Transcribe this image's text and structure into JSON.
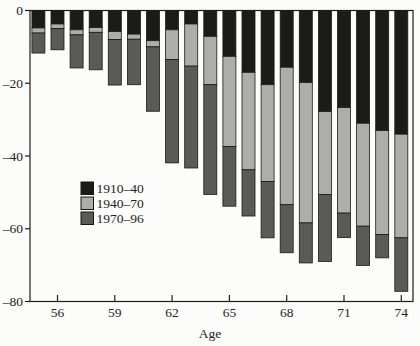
{
  "figure": {
    "xlabel": "Age",
    "background": "#fcfcfa",
    "axis_color": "#1c1c1a"
  },
  "chart_data": {
    "type": "bar",
    "stacked": true,
    "direction": "downward",
    "title": "",
    "xlabel": "Age",
    "ylabel": "",
    "ylim": [
      -80,
      0
    ],
    "yticks": [
      0,
      -20,
      -40,
      -60,
      -80
    ],
    "ytick_labels": [
      "0",
      "–20",
      "–40",
      "–60",
      "–80"
    ],
    "xticks": [
      56,
      59,
      62,
      65,
      68,
      71,
      74
    ],
    "xtick_labels": [
      "56",
      "59",
      "62",
      "65",
      "68",
      "71",
      "74"
    ],
    "grid": false,
    "legend_position": "inside-center-left",
    "categories": [
      55,
      56,
      57,
      58,
      59,
      60,
      61,
      62,
      63,
      64,
      65,
      66,
      67,
      68,
      69,
      70,
      71,
      72,
      73,
      74
    ],
    "series": [
      {
        "name": "1910–40",
        "color": "#1b1b18",
        "values": [
          -4.8,
          -3.7,
          -5.3,
          -4.7,
          -5.8,
          -6.5,
          -8.3,
          -5.3,
          -3.7,
          -7.1,
          -12.6,
          -17.0,
          -20.4,
          -15.6,
          -19.8,
          -27.8,
          -26.7,
          -31.0,
          -33.0,
          -34.0
        ]
      },
      {
        "name": "1940–70",
        "color": "#adadab",
        "values": [
          -1.4,
          -1.3,
          -1.4,
          -1.3,
          -2.2,
          -1.4,
          -1.7,
          -8.2,
          -11.6,
          -13.3,
          -24.8,
          -26.8,
          -26.6,
          -37.8,
          -38.6,
          -22.8,
          -29.0,
          -28.3,
          -28.6,
          -28.5
        ]
      },
      {
        "name": "1970–96",
        "color": "#5a5a58",
        "values": [
          -5.5,
          -5.8,
          -9.1,
          -10.3,
          -12.5,
          -12.5,
          -17.7,
          -28.4,
          -28.0,
          -30.2,
          -16.4,
          -12.7,
          -15.5,
          -13.2,
          -11.0,
          -18.4,
          -6.7,
          -10.8,
          -6.4,
          -14.7
        ]
      }
    ],
    "totals": [
      -11.7,
      -10.8,
      -15.8,
      -16.3,
      -20.5,
      -20.4,
      -27.7,
      -41.9,
      -43.3,
      -50.6,
      -53.8,
      -56.5,
      -62.5,
      -66.6,
      -69.4,
      -69.0,
      -62.4,
      -70.1,
      -68.0,
      -77.2
    ]
  },
  "layout_hints": {
    "plot": {
      "left": 30,
      "top": 10.5,
      "right": 413,
      "bottom": 301.5
    },
    "bar_width": 13,
    "age_step": 19.1,
    "first_age_center_x": 38.4,
    "legend": {
      "x": 81,
      "first_row_y": 182,
      "row_step": 15,
      "swatch": 12.5,
      "label_x": 96.5
    },
    "xlabel_pos": {
      "x": 210,
      "y": 338
    },
    "xtick_label_y": 317,
    "tick_len_y": 5,
    "tick_len_x": 6.5,
    "font_size": 13.5
  }
}
